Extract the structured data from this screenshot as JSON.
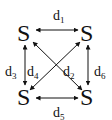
{
  "diagram": {
    "nodes": [
      {
        "id": "top-left",
        "label": "S"
      },
      {
        "id": "top-right",
        "label": "S"
      },
      {
        "id": "bottom-left",
        "label": "S"
      },
      {
        "id": "bottom-right",
        "label": "S"
      }
    ],
    "edges": [
      {
        "id": "d1",
        "base": "d",
        "sub": "1",
        "from": "top-left",
        "to": "top-right"
      },
      {
        "id": "d2",
        "base": "d",
        "sub": "2",
        "from": "top-right",
        "to": "bottom-left"
      },
      {
        "id": "d3",
        "base": "d",
        "sub": "3",
        "from": "top-left",
        "to": "bottom-left"
      },
      {
        "id": "d4",
        "base": "d",
        "sub": "4",
        "from": "top-left",
        "to": "bottom-right"
      },
      {
        "id": "d5",
        "base": "d",
        "sub": "5",
        "from": "bottom-left",
        "to": "bottom-right"
      },
      {
        "id": "d6",
        "base": "d",
        "sub": "6",
        "from": "top-right",
        "to": "bottom-right"
      }
    ],
    "arrow_color": "#111111"
  }
}
